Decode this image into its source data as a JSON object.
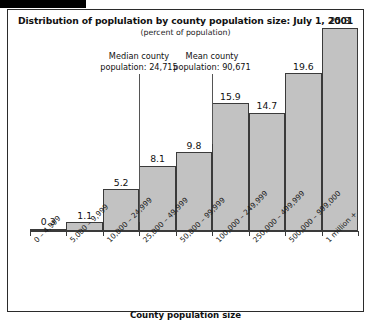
{
  "figure": {
    "title": "Distribution of poplulation by county population size: July 1, 2001",
    "subtitle": "(percent of population)",
    "xaxis_title": "County population size"
  },
  "annotations": {
    "median": {
      "line1": "Median county",
      "line2": "population: 24,715"
    },
    "mean": {
      "line1": "Mean county",
      "line2": "population: 90,671"
    }
  },
  "colors": {
    "bar_fill": "#c2c2c2",
    "bar_border": "#3a3a3a",
    "frame": "#2b2b2b",
    "text": "#111111",
    "annotation_line": "#555555"
  },
  "chart_data": {
    "type": "bar",
    "title": "Distribution of poplulation by county population size: July 1, 2001",
    "subtitle": "(percent of population)",
    "xlabel": "County population size",
    "ylabel": "",
    "ylim": [
      0,
      26.5
    ],
    "grid": false,
    "legend": false,
    "categories": [
      "0 – 4,999",
      "5,000 – 9,999",
      "10,000 – 24,999",
      "25,000 – 49,999",
      "50,000 – 99,999",
      "100,000 – 249,999",
      "250,000 – 499,999",
      "500,000 – 999,000",
      "1 million +"
    ],
    "values": [
      0.3,
      1.1,
      5.2,
      8.1,
      9.8,
      15.9,
      14.7,
      19.6,
      25.3
    ],
    "data_labels": [
      "0.3",
      "1.1",
      "5.2",
      "8.1",
      "9.8",
      "15.9",
      "14.7",
      "19.6",
      "25.3"
    ],
    "annotations": [
      {
        "name": "median-county-population",
        "text": "Median county population: 24,715",
        "value": 24715,
        "at_category": "10,000 – 24,999"
      },
      {
        "name": "mean-county-population",
        "text": "Mean county population: 90,671",
        "value": 90671,
        "at_category": "50,000 – 99,999"
      }
    ]
  }
}
